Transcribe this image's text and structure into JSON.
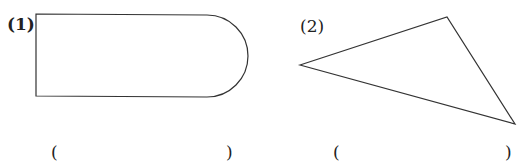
{
  "figures": [
    {
      "label": "(1)",
      "shape": "rectangle-with-semicircle-end",
      "answer_open": "(",
      "answer_close": ")"
    },
    {
      "label": "(2)",
      "shape": "triangle",
      "answer_open": "(",
      "answer_close": ")"
    }
  ],
  "colors": {
    "stroke": "#333333",
    "background": "#ffffff"
  }
}
